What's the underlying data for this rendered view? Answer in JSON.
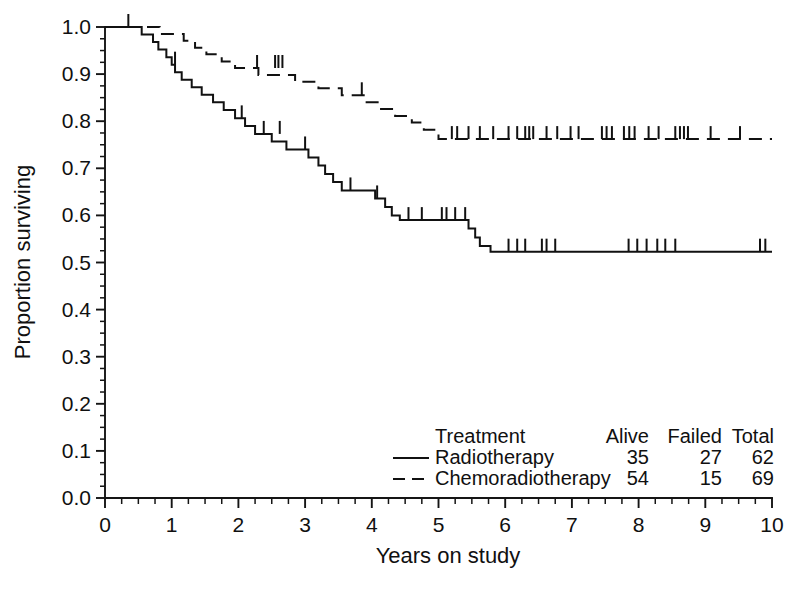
{
  "chart_data": {
    "type": "line",
    "subtype": "kaplan-meier-survival",
    "title": "",
    "xlabel": "Years on study",
    "ylabel": "Proportion surviving",
    "xlim": [
      0,
      10
    ],
    "ylim": [
      0.0,
      1.0
    ],
    "grid": false,
    "x_ticks": [
      0,
      1,
      2,
      3,
      4,
      5,
      6,
      7,
      8,
      9,
      10
    ],
    "x_tick_labels": [
      "0",
      "1",
      "2",
      "3",
      "4",
      "5",
      "6",
      "7",
      "8",
      "9",
      "10"
    ],
    "x_minor_step": 0.25,
    "y_ticks": [
      0.0,
      0.1,
      0.2,
      0.3,
      0.4,
      0.5,
      0.6,
      0.7,
      0.8,
      0.9,
      1.0
    ],
    "y_tick_labels": [
      "0.0",
      "0.1",
      "0.2",
      "0.3",
      "0.4",
      "0.5",
      "0.6",
      "0.7",
      "0.8",
      "0.9",
      "1.0"
    ],
    "y_minor_step": 0.025,
    "legend_position": "bottom-right",
    "series": [
      {
        "name": "Radiotherapy",
        "linestyle": "solid",
        "color": "#111111",
        "alive": 35,
        "failed": 27,
        "total": 62,
        "plateau_value": 0.52,
        "points": [
          [
            0.0,
            1.0
          ],
          [
            0.55,
            1.0
          ],
          [
            0.55,
            0.984
          ],
          [
            0.72,
            0.984
          ],
          [
            0.72,
            0.968
          ],
          [
            0.8,
            0.968
          ],
          [
            0.8,
            0.952
          ],
          [
            0.92,
            0.952
          ],
          [
            0.92,
            0.936
          ],
          [
            1.0,
            0.936
          ],
          [
            1.0,
            0.92
          ],
          [
            1.05,
            0.92
          ],
          [
            1.05,
            0.904
          ],
          [
            1.15,
            0.904
          ],
          [
            1.15,
            0.888
          ],
          [
            1.3,
            0.888
          ],
          [
            1.3,
            0.872
          ],
          [
            1.45,
            0.872
          ],
          [
            1.45,
            0.856
          ],
          [
            1.62,
            0.856
          ],
          [
            1.62,
            0.84
          ],
          [
            1.78,
            0.84
          ],
          [
            1.78,
            0.824
          ],
          [
            1.95,
            0.824
          ],
          [
            1.95,
            0.806
          ],
          [
            2.1,
            0.806
          ],
          [
            2.1,
            0.79
          ],
          [
            2.25,
            0.79
          ],
          [
            2.25,
            0.773
          ],
          [
            2.5,
            0.773
          ],
          [
            2.5,
            0.757
          ],
          [
            2.72,
            0.757
          ],
          [
            2.72,
            0.74
          ],
          [
            3.05,
            0.74
          ],
          [
            3.05,
            0.723
          ],
          [
            3.2,
            0.723
          ],
          [
            3.2,
            0.706
          ],
          [
            3.3,
            0.706
          ],
          [
            3.3,
            0.688
          ],
          [
            3.42,
            0.688
          ],
          [
            3.42,
            0.671
          ],
          [
            3.55,
            0.671
          ],
          [
            3.55,
            0.653
          ],
          [
            4.05,
            0.653
          ],
          [
            4.05,
            0.636
          ],
          [
            4.2,
            0.636
          ],
          [
            4.2,
            0.618
          ],
          [
            4.3,
            0.618
          ],
          [
            4.3,
            0.6
          ],
          [
            4.42,
            0.6
          ],
          [
            4.42,
            0.59
          ],
          [
            5.45,
            0.59
          ],
          [
            5.45,
            0.572
          ],
          [
            5.55,
            0.572
          ],
          [
            5.55,
            0.553
          ],
          [
            5.62,
            0.553
          ],
          [
            5.62,
            0.535
          ],
          [
            5.78,
            0.535
          ],
          [
            5.78,
            0.523
          ],
          [
            10.0,
            0.523
          ]
        ],
        "censor_marks": [
          [
            0.35,
            1.0
          ],
          [
            1.05,
            0.92
          ],
          [
            2.05,
            0.806
          ],
          [
            2.38,
            0.773
          ],
          [
            2.62,
            0.773
          ],
          [
            3.0,
            0.74
          ],
          [
            3.68,
            0.653
          ],
          [
            4.08,
            0.636
          ],
          [
            4.55,
            0.59
          ],
          [
            4.75,
            0.59
          ],
          [
            5.05,
            0.59
          ],
          [
            5.12,
            0.59
          ],
          [
            5.25,
            0.59
          ],
          [
            5.4,
            0.59
          ],
          [
            6.05,
            0.523
          ],
          [
            6.18,
            0.523
          ],
          [
            6.3,
            0.523
          ],
          [
            6.55,
            0.523
          ],
          [
            6.62,
            0.523
          ],
          [
            6.75,
            0.523
          ],
          [
            7.85,
            0.523
          ],
          [
            7.98,
            0.523
          ],
          [
            8.12,
            0.523
          ],
          [
            8.28,
            0.523
          ],
          [
            8.4,
            0.523
          ],
          [
            8.55,
            0.523
          ],
          [
            9.82,
            0.523
          ],
          [
            9.9,
            0.523
          ]
        ]
      },
      {
        "name": "Chemoradiotherapy",
        "linestyle": "dashed",
        "color": "#111111",
        "alive": 54,
        "failed": 15,
        "total": 69,
        "plateau_value": 0.76,
        "points": [
          [
            0.0,
            1.0
          ],
          [
            0.82,
            1.0
          ],
          [
            0.82,
            0.985
          ],
          [
            1.18,
            0.985
          ],
          [
            1.18,
            0.971
          ],
          [
            1.35,
            0.971
          ],
          [
            1.35,
            0.956
          ],
          [
            1.52,
            0.956
          ],
          [
            1.52,
            0.942
          ],
          [
            1.75,
            0.942
          ],
          [
            1.75,
            0.927
          ],
          [
            1.95,
            0.927
          ],
          [
            1.95,
            0.913
          ],
          [
            2.3,
            0.913
          ],
          [
            2.3,
            0.898
          ],
          [
            2.85,
            0.898
          ],
          [
            2.85,
            0.884
          ],
          [
            3.2,
            0.884
          ],
          [
            3.2,
            0.87
          ],
          [
            3.55,
            0.87
          ],
          [
            3.55,
            0.855
          ],
          [
            3.9,
            0.855
          ],
          [
            3.9,
            0.84
          ],
          [
            4.12,
            0.84
          ],
          [
            4.12,
            0.826
          ],
          [
            4.35,
            0.826
          ],
          [
            4.35,
            0.811
          ],
          [
            4.6,
            0.811
          ],
          [
            4.6,
            0.797
          ],
          [
            4.78,
            0.797
          ],
          [
            4.78,
            0.782
          ],
          [
            5.0,
            0.782
          ],
          [
            5.0,
            0.762
          ],
          [
            10.0,
            0.762
          ]
        ],
        "censor_marks": [
          [
            2.28,
            0.913
          ],
          [
            2.55,
            0.913
          ],
          [
            2.6,
            0.913
          ],
          [
            2.66,
            0.913
          ],
          [
            3.85,
            0.855
          ],
          [
            5.2,
            0.762
          ],
          [
            5.28,
            0.762
          ],
          [
            5.45,
            0.762
          ],
          [
            5.62,
            0.762
          ],
          [
            5.82,
            0.762
          ],
          [
            6.05,
            0.762
          ],
          [
            6.18,
            0.762
          ],
          [
            6.3,
            0.762
          ],
          [
            6.36,
            0.762
          ],
          [
            6.42,
            0.762
          ],
          [
            6.62,
            0.762
          ],
          [
            6.78,
            0.762
          ],
          [
            6.98,
            0.762
          ],
          [
            7.1,
            0.762
          ],
          [
            7.45,
            0.762
          ],
          [
            7.52,
            0.762
          ],
          [
            7.6,
            0.762
          ],
          [
            7.78,
            0.762
          ],
          [
            7.86,
            0.762
          ],
          [
            7.94,
            0.762
          ],
          [
            8.15,
            0.762
          ],
          [
            8.3,
            0.762
          ],
          [
            8.55,
            0.762
          ],
          [
            8.62,
            0.762
          ],
          [
            8.68,
            0.762
          ],
          [
            8.74,
            0.762
          ],
          [
            9.08,
            0.762
          ],
          [
            9.52,
            0.762
          ]
        ]
      }
    ]
  },
  "legend": {
    "header": {
      "treatment": "Treatment",
      "alive": "Alive",
      "failed": "Failed",
      "total": "Total"
    },
    "rows": [
      {
        "label": "Radiotherapy",
        "alive": "35",
        "failed": "27",
        "total": "62",
        "style": "solid"
      },
      {
        "label": "Chemoradiotherapy",
        "alive": "54",
        "failed": "15",
        "total": "69",
        "style": "dashed"
      }
    ]
  },
  "axes": {
    "x_title": "Years on study",
    "y_title": "Proportion surviving"
  },
  "colors": {
    "ink": "#111111",
    "background": "#ffffff"
  }
}
